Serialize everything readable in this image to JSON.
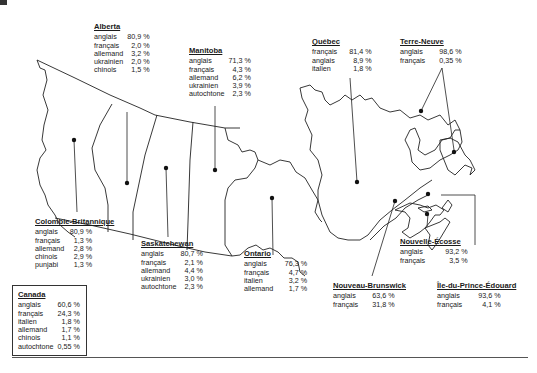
{
  "map": {
    "title": "Canada",
    "regions": [
      {
        "id": "alberta",
        "name": "Alberta",
        "languages": [
          {
            "lang": "anglais",
            "pct": "80,9 %"
          },
          {
            "lang": "français",
            "pct": "2,0 %"
          },
          {
            "lang": "allemand",
            "pct": "3,2 %"
          },
          {
            "lang": "ukrainien",
            "pct": "2,0 %"
          },
          {
            "lang": "chinois",
            "pct": "1,5 %"
          }
        ]
      },
      {
        "id": "manitoba",
        "name": "Manitoba",
        "languages": [
          {
            "lang": "anglais",
            "pct": "71,3 %"
          },
          {
            "lang": "français",
            "pct": "4,3 %"
          },
          {
            "lang": "allemand",
            "pct": "6,2 %"
          },
          {
            "lang": "ukrainien",
            "pct": "3,9 %"
          },
          {
            "lang": "autochtone",
            "pct": "2,3 %"
          }
        ]
      },
      {
        "id": "quebec",
        "name": "Québec",
        "languages": [
          {
            "lang": "français",
            "pct": "81,4 %"
          },
          {
            "lang": "anglais",
            "pct": "8,9 %"
          },
          {
            "lang": "italien",
            "pct": "1,8 %"
          }
        ]
      },
      {
        "id": "terre-neuve",
        "name": "Terre-Neuve",
        "languages": [
          {
            "lang": "anglais",
            "pct": "98,6 %"
          },
          {
            "lang": "français",
            "pct": "0,35 %"
          }
        ]
      },
      {
        "id": "colombie-britannique",
        "name": "Colombie-Britannique",
        "languages": [
          {
            "lang": "anglais",
            "pct": "80,9 %"
          },
          {
            "lang": "français",
            "pct": "1,3 %"
          },
          {
            "lang": "allemand",
            "pct": "2,8 %"
          },
          {
            "lang": "chinois",
            "pct": "2,9 %"
          },
          {
            "lang": "punjabi",
            "pct": "1,3 %"
          }
        ]
      },
      {
        "id": "saskatchewan",
        "name": "Saskatchewan",
        "languages": [
          {
            "lang": "anglais",
            "pct": "80,7 %"
          },
          {
            "lang": "français",
            "pct": "2,1 %"
          },
          {
            "lang": "allemand",
            "pct": "4,4 %"
          },
          {
            "lang": "ukrainien",
            "pct": "3,0 %"
          },
          {
            "lang": "autochtone",
            "pct": "2,3 %"
          }
        ]
      },
      {
        "id": "ontario",
        "name": "Ontario",
        "languages": [
          {
            "lang": "anglais",
            "pct": "76,3 %"
          },
          {
            "lang": "français",
            "pct": "4,7 %"
          },
          {
            "lang": "italien",
            "pct": "3,2 %"
          },
          {
            "lang": "allemand",
            "pct": "1,7 %"
          }
        ]
      },
      {
        "id": "nouvelle-ecosse",
        "name": "Nouvelle-Écosse",
        "languages": [
          {
            "lang": "anglais",
            "pct": "93,2 %"
          },
          {
            "lang": "français",
            "pct": "3,5 %"
          }
        ]
      },
      {
        "id": "nouveau-brunswick",
        "name": "Nouveau-Brunswick",
        "languages": [
          {
            "lang": "anglais",
            "pct": "63,6 %"
          },
          {
            "lang": "français",
            "pct": "31,8 %"
          }
        ]
      },
      {
        "id": "ipe",
        "name": "Île-du-Prince-Édouard",
        "languages": [
          {
            "lang": "anglais",
            "pct": "93,6 %"
          },
          {
            "lang": "français",
            "pct": "4,1 %"
          }
        ]
      }
    ],
    "national": {
      "name": "Canada",
      "languages": [
        {
          "lang": "anglais",
          "pct": "60,6 %"
        },
        {
          "lang": "français",
          "pct": "24,3 %"
        },
        {
          "lang": "italien",
          "pct": "1,8 %"
        },
        {
          "lang": "allemand",
          "pct": "1,7 %"
        },
        {
          "lang": "chinois",
          "pct": "1,1 %"
        },
        {
          "lang": "autochtone",
          "pct": "0,55 %"
        }
      ]
    }
  }
}
